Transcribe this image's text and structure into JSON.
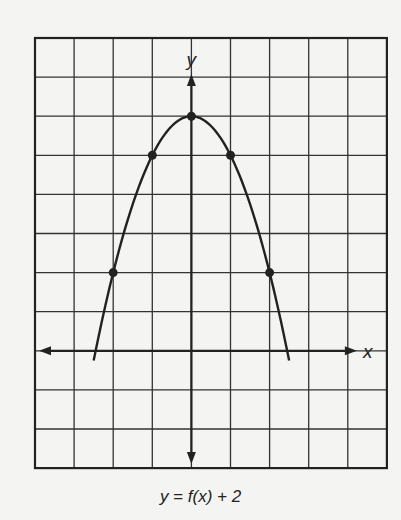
{
  "chart_data": {
    "type": "line",
    "title": "",
    "caption": "y = f(x) + 2",
    "xlabel": "x",
    "ylabel": "y",
    "xlim": [
      -4,
      5
    ],
    "ylim": [
      -3,
      8
    ],
    "grid": true,
    "grid_step": 1,
    "legend": null,
    "series": [
      {
        "name": "y = f(x) + 2",
        "equation": "y = 6 - x^2",
        "curve_x_range": [
          -2.5,
          2.5
        ],
        "marked_points": [
          {
            "x": -2,
            "y": 2
          },
          {
            "x": -1,
            "y": 5
          },
          {
            "x": 0,
            "y": 6
          },
          {
            "x": 1,
            "y": 5
          },
          {
            "x": 2,
            "y": 2
          }
        ]
      }
    ]
  },
  "labels": {
    "x_axis": "x",
    "y_axis": "y",
    "caption_prefix": "y",
    "caption": "y = f(x) + 2"
  },
  "colors": {
    "background": "#f4f4f2",
    "ink": "#222222",
    "grid": "#333333"
  }
}
